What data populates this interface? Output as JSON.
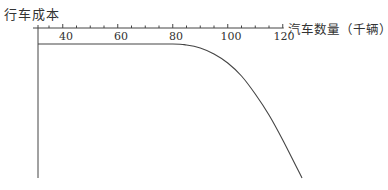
{
  "chart_data": {
    "type": "line",
    "title": "",
    "xlabel": "汽车数量（千辆）",
    "ylabel": "行车成本",
    "x_ticks": [
      40,
      60,
      80,
      100,
      120
    ],
    "x_minor_tick_step": 5,
    "xlim": [
      31,
      120
    ],
    "y_ticks": [],
    "grid": false,
    "legend": null,
    "x_axis_position": "top",
    "series": [
      {
        "name": "行车成本",
        "description": "Flat (constant cost) up to ~80, then curves downward steeply after ~85",
        "x": [
          31,
          40,
          60,
          80,
          85,
          90,
          95,
          100,
          105,
          110,
          115,
          120,
          127
        ],
        "y_px_from_top": [
          44,
          44,
          44,
          44,
          45,
          48,
          54,
          63,
          76,
          94,
          115,
          140,
          178
        ]
      }
    ],
    "line_color": "#444444"
  }
}
